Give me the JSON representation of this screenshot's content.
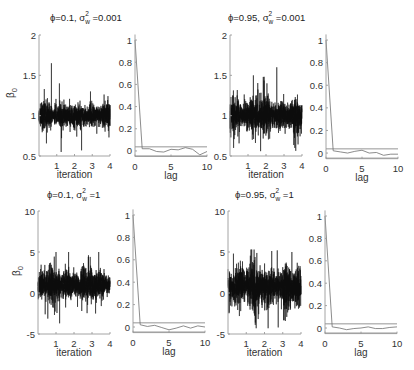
{
  "figure": {
    "background": "#ffffff",
    "trace_color": "#0d0d0d",
    "acf_color": "#6e6e6e",
    "axis_color": "#9a9a9a"
  },
  "chart_data": [
    {
      "id": "trace-phi01-s0001",
      "type": "line",
      "title": {
        "prefix": "ϕ=0.1, σ",
        "sup": "2",
        "sub": "w",
        "suffix": " =0.001"
      },
      "xlabel": "iteration",
      "ylabel": {
        "main": "β",
        "sub": "0"
      },
      "xlim": [
        0,
        4
      ],
      "ylim": [
        0.5,
        2
      ],
      "xticks": [
        1,
        2,
        3,
        4
      ],
      "xtick_labels": [
        "1",
        "2",
        "3",
        "4"
      ],
      "yticks": [
        0.5,
        1,
        1.5,
        2
      ],
      "ytick_labels": [
        "0.5",
        "1",
        "1.5",
        "2"
      ],
      "grid": false,
      "series_summary": {
        "mean": 1.0,
        "core_sd": 0.065,
        "min": 0.55,
        "max": 1.65,
        "seed": 11,
        "spikes": [
          [
            0.7,
            1.65
          ],
          [
            1.15,
            1.4
          ],
          [
            1.25,
            0.55
          ],
          [
            2.4,
            0.57
          ],
          [
            2.9,
            1.3
          ],
          [
            0.3,
            1.33
          ]
        ]
      }
    },
    {
      "id": "acf-phi01-s0001",
      "type": "line",
      "xlabel": "lag",
      "xlim": [
        0,
        10
      ],
      "ylim": [
        -0.05,
        1.05
      ],
      "xticks": [
        0,
        5,
        10
      ],
      "xtick_labels": [
        "0",
        "5",
        "10"
      ],
      "yticks": [
        0,
        0.2,
        0.4,
        0.6,
        0.8,
        1
      ],
      "ytick_labels": [
        "0",
        "0.2",
        "0.4",
        "0.6",
        "0.8",
        "1"
      ],
      "x": [
        0,
        1,
        2,
        3,
        4,
        5,
        6,
        7,
        8,
        9,
        10
      ],
      "values": [
        1,
        0.02,
        0.02,
        -0.005,
        -0.01,
        0.015,
        0.01,
        0.03,
        0.015,
        -0.035,
        -0.005
      ],
      "conf_bounds": [
        -0.045,
        0.037
      ],
      "grid": false
    },
    {
      "id": "trace-phi095-s0001",
      "type": "line",
      "title": {
        "prefix": "ϕ=0.95, σ",
        "sup": "2",
        "sub": "w",
        "suffix": " =0.001"
      },
      "xlabel": "iteration",
      "ylabel": null,
      "xlim": [
        0,
        4
      ],
      "ylim": [
        0.5,
        2
      ],
      "xticks": [
        1,
        2,
        3,
        4
      ],
      "xtick_labels": [
        "1",
        "2",
        "3",
        "4"
      ],
      "yticks": [
        0.5,
        1,
        1.5,
        2
      ],
      "ytick_labels": [
        "0.5",
        "1",
        "1.5",
        "2"
      ],
      "grid": false,
      "series_summary": {
        "mean": 1.0,
        "core_sd": 0.085,
        "min": 0.55,
        "max": 1.6,
        "seed": 23,
        "spikes": [
          [
            2.6,
            1.6
          ],
          [
            1.3,
            1.5
          ],
          [
            1.85,
            1.48
          ],
          [
            0.2,
            0.6
          ],
          [
            1.7,
            0.56
          ],
          [
            3.6,
            0.6
          ]
        ]
      }
    },
    {
      "id": "acf-phi095-s0001",
      "type": "line",
      "xlabel": "lag",
      "xlim": [
        0,
        10
      ],
      "ylim": [
        -0.05,
        1.05
      ],
      "xticks": [
        0,
        5,
        10
      ],
      "xtick_labels": [
        "0",
        "5",
        "10"
      ],
      "yticks": [
        0,
        0.2,
        0.4,
        0.6,
        0.8,
        1
      ],
      "ytick_labels": [
        "0",
        "0.2",
        "0.4",
        "0.6",
        "0.8",
        "1"
      ],
      "x": [
        0,
        1,
        2,
        3,
        4,
        5,
        6,
        7,
        8,
        9,
        10
      ],
      "values": [
        1,
        0.02,
        0.01,
        0.0,
        0.015,
        0.025,
        0.0,
        0.005,
        -0.02,
        -0.01,
        -0.01
      ],
      "conf_bounds": [
        -0.045,
        0.037
      ],
      "grid": false
    },
    {
      "id": "trace-phi01-s1",
      "type": "line",
      "title": {
        "prefix": "ϕ=0.1, σ",
        "sup": "2",
        "sub": "w",
        "suffix": " =1"
      },
      "xlabel": "iteration",
      "ylabel": {
        "main": "β",
        "sub": "0"
      },
      "xlim": [
        0,
        4
      ],
      "ylim": [
        -5,
        10
      ],
      "xticks": [
        1,
        2,
        3,
        4
      ],
      "xtick_labels": [
        "1",
        "2",
        "3",
        "4"
      ],
      "yticks": [
        -5,
        0,
        5,
        10
      ],
      "ytick_labels": [
        "-5",
        "0",
        "5",
        "10"
      ],
      "grid": false,
      "series_summary": {
        "mean": 1.0,
        "core_sd": 0.85,
        "min": -3.7,
        "max": 5.0,
        "seed": 37,
        "spikes": [
          [
            1.0,
            5.0
          ],
          [
            1.7,
            5.0
          ],
          [
            1.2,
            -3.7
          ],
          [
            0.4,
            -2.6
          ],
          [
            3.2,
            -2.5
          ],
          [
            2.9,
            4.4
          ]
        ]
      }
    },
    {
      "id": "acf-phi01-s1",
      "type": "line",
      "xlabel": "lag",
      "xlim": [
        0,
        10
      ],
      "ylim": [
        -0.05,
        1.05
      ],
      "xticks": [
        0,
        5,
        10
      ],
      "xtick_labels": [
        "0",
        "5",
        "10"
      ],
      "yticks": [
        0,
        0.2,
        0.4,
        0.6,
        0.8,
        1
      ],
      "ytick_labels": [
        "0",
        "0.2",
        "0.4",
        "0.6",
        "0.8",
        "1"
      ],
      "x": [
        0,
        1,
        2,
        3,
        4,
        5,
        6,
        7,
        8,
        9,
        10
      ],
      "values": [
        1,
        0.02,
        0.005,
        0.015,
        -0.005,
        -0.025,
        -0.01,
        0.01,
        -0.01,
        0.01,
        0.0
      ],
      "conf_bounds": [
        -0.045,
        0.037
      ],
      "grid": false
    },
    {
      "id": "trace-phi095-s1",
      "type": "line",
      "title": {
        "prefix": "ϕ=0.95, σ",
        "sup": "2",
        "sub": "w",
        "suffix": " =1"
      },
      "xlabel": "iteration",
      "ylabel": null,
      "xlim": [
        0,
        4
      ],
      "ylim": [
        -5,
        10
      ],
      "xticks": [
        1,
        2,
        3,
        4
      ],
      "xtick_labels": [
        "1",
        "2",
        "3",
        "4"
      ],
      "yticks": [
        -5,
        0,
        5,
        10
      ],
      "ytick_labels": [
        "-5",
        "0",
        "5",
        "10"
      ],
      "grid": false,
      "series_summary": {
        "mean": 0.8,
        "core_sd": 1.05,
        "min": -4.3,
        "max": 5.3,
        "seed": 53,
        "spikes": [
          [
            0.3,
            4.8
          ],
          [
            1.3,
            5.3
          ],
          [
            2.7,
            5.2
          ],
          [
            3.5,
            5.0
          ],
          [
            2.2,
            -4.3
          ],
          [
            2.75,
            -4.2
          ],
          [
            1.5,
            -3.6
          ]
        ]
      }
    },
    {
      "id": "acf-phi095-s1",
      "type": "line",
      "xlabel": "lag",
      "xlim": [
        0,
        10
      ],
      "ylim": [
        -0.05,
        1.05
      ],
      "xticks": [
        0,
        5,
        10
      ],
      "xtick_labels": [
        "0",
        "5",
        "10"
      ],
      "yticks": [
        0,
        0.2,
        0.4,
        0.6,
        0.8,
        1
      ],
      "ytick_labels": [
        "0",
        "0.2",
        "0.4",
        "0.6",
        "0.8",
        "1"
      ],
      "x": [
        0,
        1,
        2,
        3,
        4,
        5,
        6,
        7,
        8,
        9,
        10
      ],
      "values": [
        1,
        0.01,
        0.0,
        -0.015,
        -0.005,
        0.0,
        0.01,
        -0.005,
        -0.005,
        0.005,
        0.01
      ],
      "conf_bounds": [
        -0.045,
        0.037
      ],
      "grid": false
    }
  ]
}
